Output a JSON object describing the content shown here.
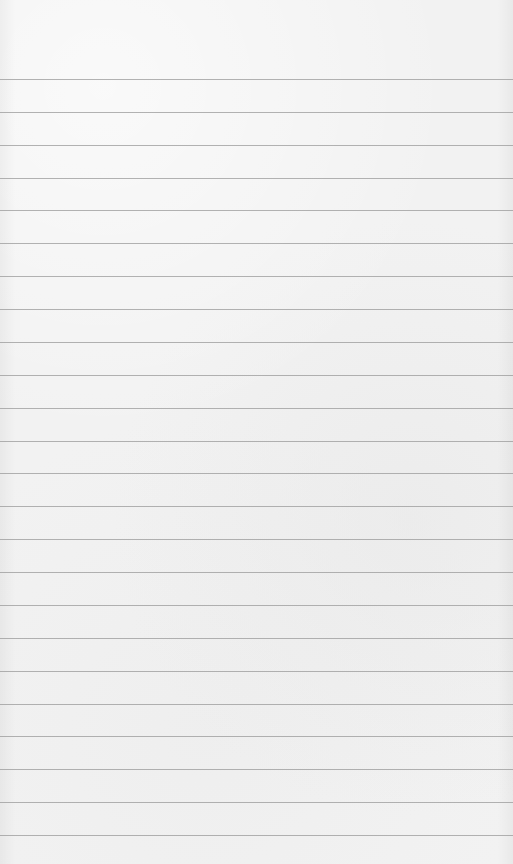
{
  "paper": {
    "background_color": "#f2f2f2",
    "line_color": "#9a9a9a",
    "first_line_y": 79,
    "line_spacing": 32.87,
    "line_count": 24
  }
}
